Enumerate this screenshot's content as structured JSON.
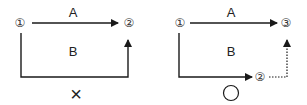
{
  "diagrams": [
    {
      "name": "incorrect",
      "start_node": "①",
      "end_node": "②",
      "route_a_label": "A",
      "route_b_label": "B",
      "verdict": "×"
    },
    {
      "name": "correct",
      "start_node": "①",
      "end_node": "③",
      "mid_node": "②",
      "route_a_label": "A",
      "route_b_label": "B",
      "verdict": "○"
    }
  ],
  "colors": {
    "line": "#1a1a1a",
    "text": "#222222"
  }
}
